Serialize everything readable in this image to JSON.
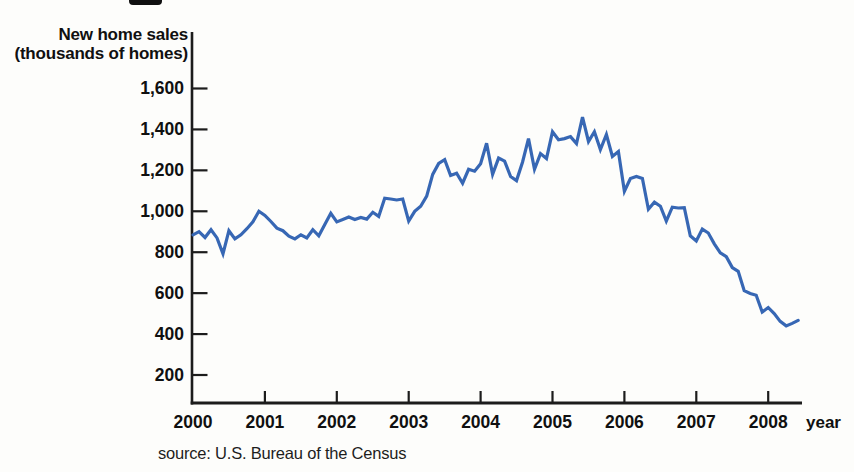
{
  "figure": {
    "y_axis_title_line1": "New home sales",
    "y_axis_title_line2": "(thousands of homes)",
    "x_axis_unit_label": "year",
    "source": "source: U.S. Bureau of the Census"
  },
  "chart_data": {
    "type": "line",
    "title": "New home sales",
    "xlabel": "year",
    "ylabel": "New home sales (thousands of homes)",
    "x_unit": "month",
    "x_range": [
      "2000-01",
      "2008-06"
    ],
    "x_ticks": [
      2000,
      2001,
      2002,
      2003,
      2004,
      2005,
      2006,
      2007,
      2008
    ],
    "y_ticks": [
      200,
      400,
      600,
      800,
      1000,
      1200,
      1400,
      1600
    ],
    "ylim": [
      60,
      1700
    ],
    "grid": false,
    "legend": "none",
    "line_color": "#3767b4",
    "axis_color": "#1c1c1c",
    "series": [
      {
        "name": "New home sales (thousands of homes, monthly)",
        "start": "2000-01",
        "values": [
          885,
          900,
          872,
          910,
          870,
          792,
          905,
          865,
          885,
          915,
          948,
          1000,
          980,
          950,
          918,
          905,
          878,
          865,
          885,
          870,
          910,
          880,
          935,
          990,
          948,
          960,
          972,
          960,
          970,
          962,
          995,
          975,
          1064,
          1060,
          1055,
          1060,
          952,
          1000,
          1025,
          1074,
          1180,
          1234,
          1252,
          1175,
          1186,
          1137,
          1205,
          1196,
          1232,
          1332,
          1180,
          1260,
          1245,
          1170,
          1150,
          1240,
          1355,
          1205,
          1282,
          1258,
          1389,
          1350,
          1355,
          1365,
          1331,
          1460,
          1341,
          1389,
          1302,
          1375,
          1268,
          1292,
          1098,
          1160,
          1170,
          1160,
          1010,
          1045,
          1025,
          952,
          1020,
          1016,
          1018,
          880,
          855,
          913,
          894,
          841,
          797,
          778,
          725,
          706,
          612,
          598,
          590,
          508,
          530,
          500,
          462,
          440,
          452,
          467
        ]
      }
    ]
  }
}
